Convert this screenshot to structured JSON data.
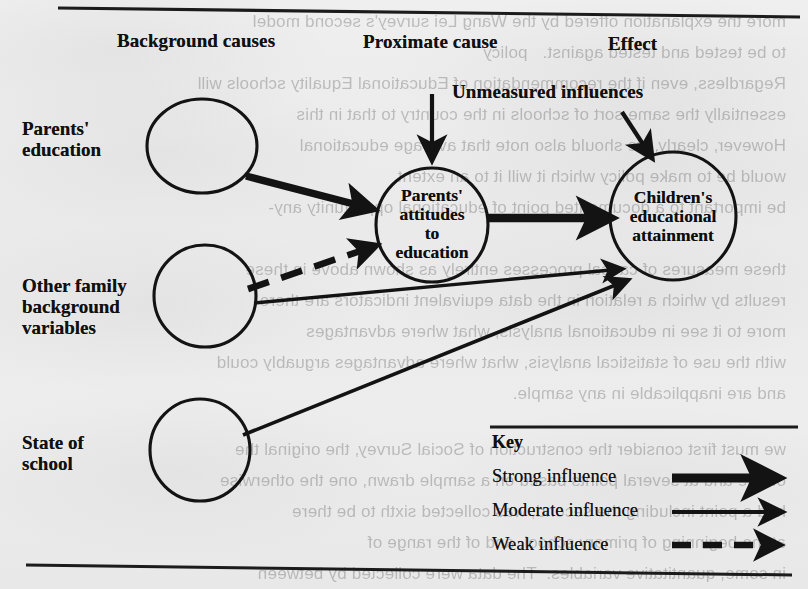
{
  "diagram": {
    "column_headers": [
      {
        "id": "background-causes",
        "label": "Background causes"
      },
      {
        "id": "proximate-cause",
        "label": "Proximate cause"
      },
      {
        "id": "effect",
        "label": "Effect"
      }
    ],
    "floating_labels": [
      {
        "id": "unmeasured-influences",
        "label": "Unmeasured influences"
      }
    ],
    "row_labels": [
      {
        "id": "parents-education",
        "lines": [
          "Parents'",
          "education"
        ]
      },
      {
        "id": "other-family-background",
        "lines": [
          "Other family",
          "background",
          "variables"
        ]
      },
      {
        "id": "state-of-school",
        "lines": [
          "State of",
          "school"
        ]
      }
    ],
    "nodes": [
      {
        "id": "parents-education-node",
        "label": "",
        "cx": 202,
        "cy": 146,
        "rx": 55,
        "ry": 47
      },
      {
        "id": "other-family-node",
        "label": "",
        "cx": 205,
        "cy": 296,
        "rx": 51,
        "ry": 51
      },
      {
        "id": "state-of-school-node",
        "label": "",
        "cx": 200,
        "cy": 450,
        "rx": 50,
        "ry": 51
      },
      {
        "id": "parents-attitudes-node",
        "label": "Parents' attitudes to education",
        "cx": 432,
        "cy": 225,
        "rx": 56,
        "ry": 57
      },
      {
        "id": "children-attainment-node",
        "label": "Children's educational attainment",
        "cx": 673,
        "cy": 216,
        "rx": 63,
        "ry": 64
      }
    ],
    "node_text_lines": {
      "parents-attitudes-node": [
        "Parents'",
        "attitudes",
        "to",
        "education"
      ],
      "children-attainment-node": [
        "Children's",
        "educational",
        "attainment"
      ]
    },
    "edges": [
      {
        "id": "edge-parents-education-to-attitudes",
        "from": "parents-education-node",
        "to": "parents-attitudes-node",
        "strength": "strong"
      },
      {
        "id": "edge-other-family-to-attitudes",
        "from": "other-family-node",
        "to": "parents-attitudes-node",
        "strength": "weak"
      },
      {
        "id": "edge-attitudes-to-attainment",
        "from": "parents-attitudes-node",
        "to": "children-attainment-node",
        "strength": "strong"
      },
      {
        "id": "edge-other-family-to-attainment",
        "from": "other-family-node",
        "to": "children-attainment-node",
        "strength": "moderate"
      },
      {
        "id": "edge-state-of-school-to-attainment",
        "from": "state-of-school-node",
        "to": "children-attainment-node",
        "strength": "moderate"
      },
      {
        "id": "edge-unmeasured-to-attitudes",
        "from": "unmeasured-influences",
        "to": "parents-attitudes-node",
        "strength": "moderate"
      },
      {
        "id": "edge-unmeasured-to-attainment",
        "from": "unmeasured-influences",
        "to": "children-attainment-node",
        "strength": "moderate"
      }
    ],
    "legend": {
      "title": "Key",
      "items": [
        {
          "id": "legend-strong",
          "label": "Strong influence",
          "style": "thick-solid"
        },
        {
          "id": "legend-moderate",
          "label": "Moderate influence",
          "style": "thin-solid"
        },
        {
          "id": "legend-weak",
          "label": "Weak influence",
          "style": "dashed"
        }
      ]
    },
    "colors": {
      "ink": "#101010",
      "paper": "#ececec"
    },
    "bleed_through_text": [
      "more the explanation offered by the Wang Lei survey's second model",
      "to be tested and tested against.   policy",
      "Regardless, even if the recommendation of Educational Equality schools will",
      "essentially the same sort of schools in the country to that in this",
      "However, clearly, we should also note that average educational",
      "would be to make policy which it will it to an extent",
      "be important to a documented point of educational opportunity any-",
      "",
      "these measures of causal processes entirely as shown above in these",
      "results by which a relation in the data equivalent indicators are there",
      "more to it see in educational analysis, what where advantages",
      "with the use of statistical analysis, what where advantages arguably could",
      "and are inapplicable in any sample.",
      "",
      "we must first consider the construction of Social Survey, the original the",
      "of age and at several points based on a sample drawn, one the otherwise",
      "had a point including the second, was collected sixth to be there",
      "at the beginning of primary school, and of the range of",
      "in some, quantitative variables.  The data were collected by between"
    ]
  }
}
